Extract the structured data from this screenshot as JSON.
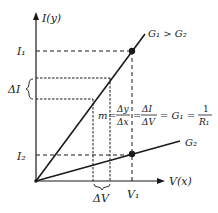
{
  "diagram": {
    "y_axis_label": "I(y)",
    "x_axis_label": "V(x)",
    "lines": [
      {
        "name": "G1",
        "label": "G₁ > G₂",
        "description": "steeper line through origin"
      },
      {
        "name": "G2",
        "label": "G₂",
        "description": "shallower line through origin"
      }
    ],
    "y_ticks": [
      {
        "label": "I₁"
      },
      {
        "label": "I₂"
      }
    ],
    "x_ticks": [
      {
        "label": "V₁"
      }
    ],
    "delta_labels": {
      "delta_i": "ΔI",
      "delta_v": "ΔV"
    },
    "equation": {
      "m": "m",
      "eq1": "=",
      "frac1_num": "Δy",
      "frac1_den": "Δx",
      "eq2": "=",
      "frac2_num": "ΔI",
      "frac2_den": "ΔV",
      "eq3": "= G₁ =",
      "frac3_num": "1",
      "frac3_den": "R₁"
    },
    "colors": {
      "line": "#1a1a1a",
      "background": "#ffffff"
    }
  }
}
